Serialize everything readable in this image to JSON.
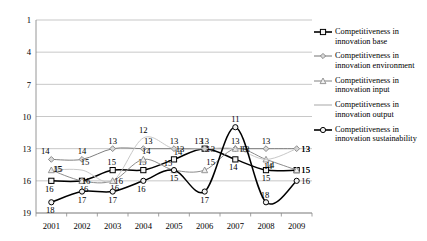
{
  "chart_data": {
    "type": "line",
    "title": "",
    "xlabel": "",
    "ylabel": "",
    "categories": [
      "2001",
      "2002",
      "2003",
      "2004",
      "2005",
      "2006",
      "2007",
      "2008",
      "2009"
    ],
    "yticks": [
      1,
      4,
      7,
      10,
      13,
      16,
      19
    ],
    "ylim": [
      1,
      19
    ],
    "y_axis_inverted": true,
    "grid": true,
    "legend_position": "right",
    "series": [
      {
        "name": "Competitiveness in innovation base",
        "marker": "square",
        "color": "#000000",
        "values": [
          16,
          16,
          15,
          15,
          14,
          13,
          14,
          15,
          15
        ],
        "labels": [
          "16",
          "16",
          "15",
          "15",
          "14",
          "13",
          "14",
          "15",
          "15"
        ]
      },
      {
        "name": "Competitiveness in innovation environment",
        "marker": "diamond",
        "color": "#808080",
        "values": [
          14,
          14,
          13,
          13,
          13,
          13,
          13,
          13,
          13
        ],
        "labels": [
          "14",
          "14",
          "13",
          "13",
          "13",
          "13",
          "13",
          "13",
          "13"
        ]
      },
      {
        "name": "Competitiveness in innovation input",
        "marker": "triangle",
        "color": "#8c8c8c",
        "values": [
          15,
          16,
          16,
          14,
          15,
          15,
          13,
          14,
          15
        ],
        "labels": [
          "15",
          "16",
          "16",
          "14",
          "15",
          "15",
          "13",
          "14",
          "15"
        ]
      },
      {
        "name": "Competitiveness in innovation output",
        "marker": "none",
        "color": "#c8c8c8",
        "values": [
          15,
          15,
          16,
          12,
          13,
          13,
          13,
          14,
          13
        ],
        "labels": [
          "15",
          "15",
          "16",
          "12",
          "13",
          "13",
          "13",
          "14",
          "13"
        ]
      },
      {
        "name": "Competitiveness in innovation sustainability",
        "marker": "circle",
        "color": "#000000",
        "values": [
          18,
          17,
          17,
          16,
          15,
          17,
          11,
          18,
          16
        ],
        "labels": [
          "18",
          "17",
          "17",
          "16",
          "15",
          "17",
          "11",
          "18",
          "16"
        ]
      }
    ]
  },
  "legend": {
    "items": [
      {
        "label": "Competitiveness in innovation base"
      },
      {
        "label": "Competitiveness in innovation environment"
      },
      {
        "label": "Competitiveness in innovation input"
      },
      {
        "label": "Competitiveness in innovation output"
      },
      {
        "label": "Competitiveness in innovation sustainability"
      }
    ]
  }
}
